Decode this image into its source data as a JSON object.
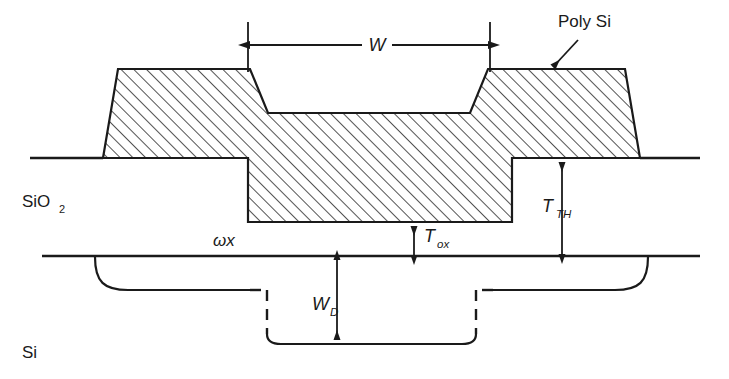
{
  "figure": {
    "background_color": "#ffffff",
    "line_color": "#1a1a1a",
    "hatch_color": "#1a1a1a"
  },
  "labels": {
    "poly_si": "Poly Si",
    "sio2_main": "SiO",
    "sio2_sub": "2",
    "si": "Si",
    "omega_x": "ωx",
    "w": "W",
    "t_ox_main": "T",
    "t_ox_sub": "ox",
    "t_th_main": "T",
    "t_th_sub": "TH",
    "w_d_main": "W",
    "w_d_sub": "D"
  },
  "annotations": {
    "poly_si_leader": "arrow pointing down-left to polysilicon gate",
    "w_dimension": "double-headed horizontal arrow spanning gate recess width",
    "t_ox_dimension": "double-headed vertical arrow for gate oxide thickness",
    "t_th_dimension": "double-headed vertical arrow for thick oxide height",
    "w_d_dimension": "double-headed vertical arrow for depletion width"
  },
  "regions": {
    "poly_si_gate": "hatched conductor layer over recessed and field oxide",
    "sio2_layer": "oxide region between poly gate and silicon surface",
    "si_substrate": "silicon substrate below surface line",
    "depletion_boundary": "dashed/solid curve marking depletion edge"
  }
}
